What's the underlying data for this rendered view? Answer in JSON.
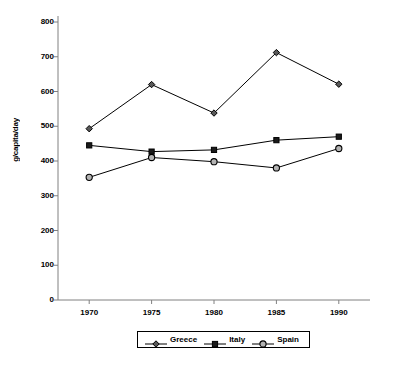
{
  "chart_data": {
    "type": "line",
    "title": "",
    "xlabel": "",
    "ylabel": "g/capita/day",
    "x": [
      1970,
      1975,
      1980,
      1985,
      1990
    ],
    "xtick_labels": [
      "1970",
      "1975",
      "1980",
      "1985",
      "1990"
    ],
    "ytick_labels": [
      "0",
      "100",
      "200",
      "300",
      "400",
      "500",
      "600",
      "700",
      "800"
    ],
    "ytick_values": [
      0,
      100,
      200,
      300,
      400,
      500,
      600,
      700,
      800
    ],
    "ylim": [
      0,
      800
    ],
    "xlim": [
      1967.5,
      1992.5
    ],
    "grid": false,
    "legend_position": "bottom-center",
    "series": [
      {
        "name": "Greece",
        "marker": "diamond",
        "marker_fill": "#595959",
        "color": "#000000",
        "values": [
          493,
          620,
          538,
          712,
          621
        ]
      },
      {
        "name": "Italy",
        "marker": "square",
        "marker_fill": "#1a1a1a",
        "color": "#000000",
        "values": [
          445,
          427,
          432,
          460,
          470
        ]
      },
      {
        "name": "Spain",
        "marker": "circle",
        "marker_fill": "#b3b3b3",
        "color": "#000000",
        "values": [
          353,
          410,
          398,
          380,
          436
        ]
      }
    ]
  },
  "axes": {
    "y_axis_title": "g/capita/day",
    "axis_color": "#808080",
    "tick_color": "#808080"
  },
  "legend": {
    "items": [
      {
        "label": "Greece",
        "marker": "diamond-icon"
      },
      {
        "label": "Italy",
        "marker": "square-icon"
      },
      {
        "label": "Spain",
        "marker": "circle-icon"
      }
    ]
  }
}
